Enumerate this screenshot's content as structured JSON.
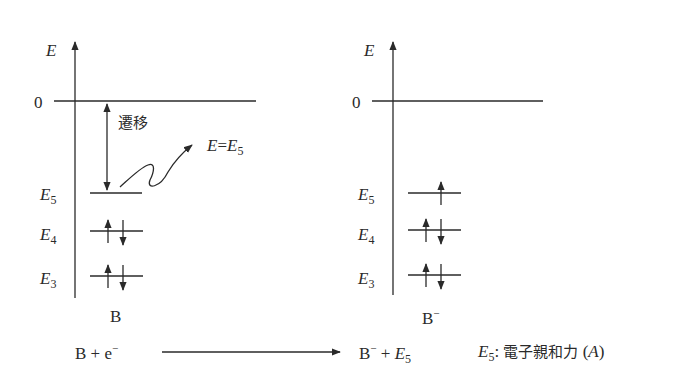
{
  "diagram": {
    "left_panel": {
      "axis_label": "E",
      "zero_label": "0",
      "transition_label": "遷移",
      "photon_label_lhs": "E",
      "photon_label_eq": "=",
      "photon_label_rhs": "E",
      "photon_label_rhs_sub": "5",
      "levels": [
        {
          "name": "E",
          "sub": "5",
          "electrons": "empty"
        },
        {
          "name": "E",
          "sub": "4",
          "electrons": "paired"
        },
        {
          "name": "E",
          "sub": "3",
          "electrons": "paired"
        }
      ],
      "species_label": "B"
    },
    "right_panel": {
      "axis_label": "E",
      "zero_label": "0",
      "levels": [
        {
          "name": "E",
          "sub": "5",
          "electrons": "single-up"
        },
        {
          "name": "E",
          "sub": "4",
          "electrons": "paired"
        },
        {
          "name": "E",
          "sub": "3",
          "electrons": "paired"
        }
      ],
      "species_label": "B",
      "species_sup": "−"
    },
    "equation": {
      "reactant": "B + e",
      "reactant_sup": "−",
      "product_species": "B",
      "product_sup": "−",
      "product_plus": " + ",
      "product_energy": "E",
      "product_energy_sub": "5",
      "note_symbol": "E",
      "note_sub": "5",
      "note_colon": ": ",
      "note_text": "電子親和力",
      "note_paren_open": " (",
      "note_symbol_A": "A",
      "note_paren_close": ")"
    }
  }
}
